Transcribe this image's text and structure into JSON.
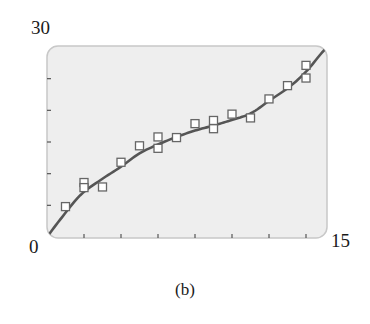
{
  "chart_data": {
    "type": "scatter",
    "title": "",
    "caption": "(b)",
    "xlabel": "",
    "ylabel": "",
    "xlim": [
      0,
      15
    ],
    "ylim": [
      0,
      30
    ],
    "x_tick_labels": {
      "min": "0",
      "max": "15"
    },
    "y_tick_labels": {
      "min": "0",
      "max": "30"
    },
    "x_ticks": [
      2,
      4,
      6,
      8,
      10,
      12,
      14
    ],
    "y_ticks": [
      5,
      10,
      15,
      20,
      25
    ],
    "grid": false,
    "legend": null,
    "series": [
      {
        "name": "data",
        "marker": "open-square",
        "points": [
          {
            "x": 1,
            "y": 4.8
          },
          {
            "x": 2,
            "y": 8.6
          },
          {
            "x": 2,
            "y": 7.8
          },
          {
            "x": 3,
            "y": 7.9
          },
          {
            "x": 4,
            "y": 11.8
          },
          {
            "x": 5,
            "y": 14.4
          },
          {
            "x": 6,
            "y": 15.8
          },
          {
            "x": 6,
            "y": 14.0
          },
          {
            "x": 7,
            "y": 15.7
          },
          {
            "x": 8,
            "y": 17.9
          },
          {
            "x": 9,
            "y": 18.4
          },
          {
            "x": 9,
            "y": 17.1
          },
          {
            "x": 10,
            "y": 19.4
          },
          {
            "x": 11,
            "y": 18.8
          },
          {
            "x": 12,
            "y": 21.8
          },
          {
            "x": 13,
            "y": 23.9
          },
          {
            "x": 14,
            "y": 27.1
          },
          {
            "x": 14,
            "y": 25.1
          }
        ]
      },
      {
        "name": "cubic fit",
        "marker": "line",
        "points": [
          {
            "x": 0.0,
            "y": 0.0
          },
          {
            "x": 0.7,
            "y": 2.7
          },
          {
            "x": 1.8,
            "y": 6.6
          },
          {
            "x": 2.9,
            "y": 9.0
          },
          {
            "x": 4.0,
            "y": 11.1
          },
          {
            "x": 5.0,
            "y": 13.2
          },
          {
            "x": 6.0,
            "y": 14.6
          },
          {
            "x": 7.0,
            "y": 15.8
          },
          {
            "x": 8.0,
            "y": 16.8
          },
          {
            "x": 9.0,
            "y": 17.6
          },
          {
            "x": 9.9,
            "y": 18.4
          },
          {
            "x": 11.0,
            "y": 19.5
          },
          {
            "x": 12.0,
            "y": 21.5
          },
          {
            "x": 13.1,
            "y": 23.7
          },
          {
            "x": 14.0,
            "y": 26.1
          },
          {
            "x": 14.8,
            "y": 28.9
          },
          {
            "x": 15.2,
            "y": 30.2
          }
        ]
      }
    ]
  },
  "colors": {
    "plot_background": "#eeeeee",
    "plot_border": "#c8c8c8",
    "curve": "#555555",
    "marker_stroke": "#666666",
    "marker_fill": "#ffffff",
    "tick": "#555555",
    "text": "#1a1a1a"
  }
}
